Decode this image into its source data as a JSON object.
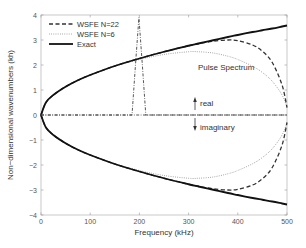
{
  "chart_data": {
    "type": "line",
    "title": "",
    "xlabel": "Frequency (kHz)",
    "ylabel": "Non−dimensional wavenumbers (kh)",
    "xlim": [
      0,
      500
    ],
    "ylim": [
      -4,
      4
    ],
    "xticks": [
      0,
      100,
      200,
      300,
      400,
      500
    ],
    "yticks": [
      -4,
      -3,
      -2,
      -1,
      0,
      1,
      2,
      3,
      4
    ],
    "grid": false,
    "legend_position": "upper left",
    "legend": [
      "WSFE N=22",
      "WSFE N=6",
      "Exact"
    ],
    "x": [
      0,
      10,
      25,
      50,
      75,
      100,
      150,
      200,
      250,
      300,
      320,
      350,
      380,
      400,
      430,
      450,
      470,
      490,
      500
    ],
    "series": [
      {
        "name": "Exact",
        "style": "solid",
        "real": [
          0,
          0.5,
          0.8,
          1.13,
          1.39,
          1.6,
          1.96,
          2.26,
          2.53,
          2.77,
          2.86,
          2.99,
          3.12,
          3.2,
          3.32,
          3.39,
          3.46,
          3.54,
          3.58
        ],
        "imaginary": [
          0,
          -0.5,
          -0.8,
          -1.13,
          -1.39,
          -1.6,
          -1.96,
          -2.26,
          -2.53,
          -2.77,
          -2.86,
          -2.99,
          -3.12,
          -3.2,
          -3.32,
          -3.39,
          -3.46,
          -3.54,
          -3.58
        ]
      },
      {
        "name": "WSFE N=22",
        "style": "dashed",
        "real": [
          0,
          0.5,
          0.8,
          1.13,
          1.39,
          1.6,
          1.96,
          2.26,
          2.53,
          2.77,
          2.85,
          2.95,
          3.0,
          2.97,
          2.8,
          2.55,
          2.1,
          1.2,
          0.3
        ],
        "imaginary": [
          0,
          -0.5,
          -0.8,
          -1.13,
          -1.39,
          -1.6,
          -1.96,
          -2.26,
          -2.53,
          -2.77,
          -2.85,
          -2.95,
          -3.0,
          -2.97,
          -2.8,
          -2.55,
          -2.1,
          -1.2,
          -0.3
        ]
      },
      {
        "name": "WSFE N=6",
        "style": "dotted",
        "real": [
          0,
          0.5,
          0.8,
          1.13,
          1.39,
          1.6,
          1.95,
          2.22,
          2.42,
          2.53,
          2.53,
          2.48,
          2.35,
          2.22,
          1.95,
          1.7,
          1.35,
          0.8,
          0.3
        ],
        "imaginary": [
          0,
          -0.5,
          -0.8,
          -1.13,
          -1.39,
          -1.6,
          -1.95,
          -2.22,
          -2.42,
          -2.53,
          -2.53,
          -2.48,
          -2.35,
          -2.22,
          -1.95,
          -1.7,
          -1.35,
          -0.8,
          -0.3
        ]
      },
      {
        "name": "Pulse Spectrum",
        "style": "dash-dot",
        "x": [
          0,
          185,
          192,
          199,
          206,
          213,
          500
        ],
        "values": [
          0,
          0,
          2.0,
          3.9,
          2.0,
          0,
          0
        ]
      }
    ],
    "annotations": [
      {
        "text": "Pulse Spectrum",
        "x": 215,
        "y": 1.95
      },
      {
        "text": "real",
        "x": 312,
        "y": 0.55,
        "arrow": "up"
      },
      {
        "text": "imaginary",
        "x": 312,
        "y": -0.65,
        "arrow": "down"
      }
    ]
  },
  "labels": {
    "xlabel": "Frequency (kHz)",
    "ylabel": "Non−dimensional wavenumbers (kh)",
    "pulse": "Pulse Spectrum",
    "real": "real",
    "imaginary": "imaginary",
    "legend_n22": "WSFE N=22",
    "legend_n6": "WSFE N=6",
    "legend_exact": "Exact"
  },
  "ticks": {
    "x": [
      "0",
      "100",
      "200",
      "300",
      "400",
      "500"
    ],
    "y": [
      "4",
      "3",
      "2",
      "1",
      "0",
      "−1",
      "−2",
      "−3",
      "−4"
    ]
  }
}
